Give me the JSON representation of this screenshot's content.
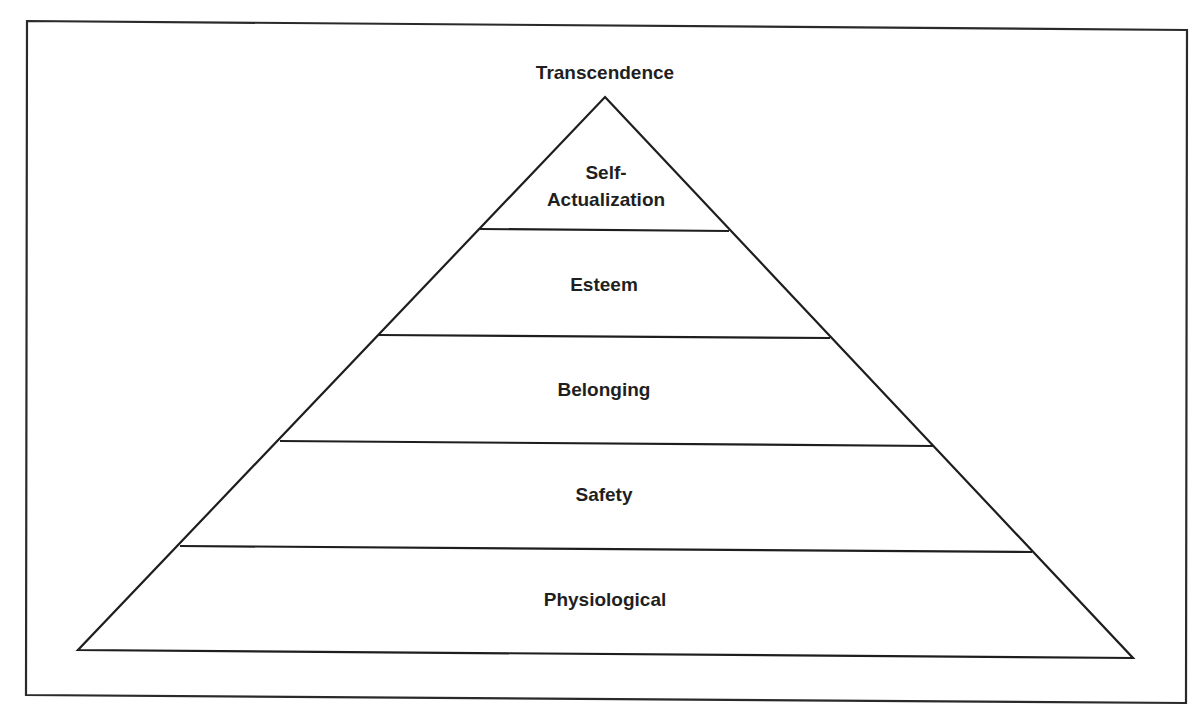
{
  "diagram": {
    "type": "pyramid",
    "apex_label": "Transcendence",
    "levels": [
      {
        "label_line1": "Self-",
        "label_line2": "Actualization"
      },
      {
        "label": "Esteem"
      },
      {
        "label": "Belonging"
      },
      {
        "label": "Safety"
      },
      {
        "label": "Physiological"
      }
    ],
    "order": "top-to-bottom",
    "colors": {
      "line": "#1e1e1e",
      "text": "#1f1f1f",
      "background": "#ffffff"
    }
  }
}
